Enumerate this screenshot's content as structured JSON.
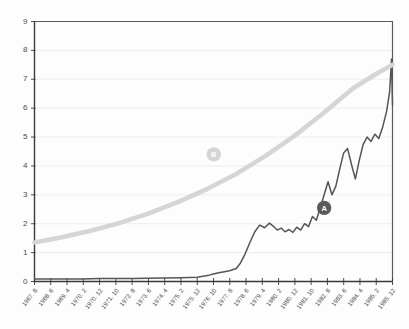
{
  "chart_data": {
    "type": "line",
    "title": "",
    "subtitle": "",
    "xlabel": "",
    "ylabel": "",
    "ylim": [
      0,
      9
    ],
    "grid": true,
    "legend_position": "none",
    "y_ticks": [
      0,
      1,
      2,
      3,
      4,
      5,
      6,
      7,
      8,
      9
    ],
    "categories": [
      "1967. 8",
      "1968. 6",
      "1969. 4",
      "1970. 2",
      "1970. 12",
      "1971. 10",
      "1972. 8",
      "1973. 6",
      "1974. 4",
      "1975. 2",
      "1975. 12",
      "1976. 10",
      "1977. 8",
      "1978. 6",
      "1979. 4",
      "1980. 2",
      "1980. 12",
      "1981. 10",
      "1982. 8",
      "1983. 6",
      "1984. 4",
      "1985. 2",
      "1985. 12"
    ],
    "series": [
      {
        "name": "A",
        "style": "observed",
        "color": "#555555",
        "x": [
          1967.67,
          1968.5,
          1969.33,
          1970.17,
          1971.0,
          1971.83,
          1972.67,
          1973.5,
          1974.33,
          1975.17,
          1976.0,
          1976.3,
          1976.6,
          1976.83,
          1977.1,
          1977.4,
          1977.7,
          1978.0,
          1978.2,
          1978.45,
          1978.7,
          1978.95,
          1979.2,
          1979.45,
          1979.7,
          1979.95,
          1980.1,
          1980.3,
          1980.5,
          1980.7,
          1980.9,
          1981.1,
          1981.3,
          1981.5,
          1981.7,
          1981.9,
          1982.1,
          1982.3,
          1982.5,
          1982.7,
          1982.9,
          1983.1,
          1983.3,
          1983.5,
          1983.7,
          1983.9,
          1984.1,
          1984.3,
          1984.5,
          1984.7,
          1984.9,
          1985.1,
          1985.3,
          1985.5,
          1985.7,
          1985.85,
          1985.95,
          1986.0
        ],
        "values": [
          0.09,
          0.09,
          0.09,
          0.09,
          0.1,
          0.1,
          0.1,
          0.11,
          0.12,
          0.13,
          0.15,
          0.18,
          0.22,
          0.26,
          0.3,
          0.34,
          0.38,
          0.45,
          0.62,
          0.95,
          1.35,
          1.72,
          1.95,
          1.86,
          2.02,
          1.88,
          1.78,
          1.85,
          1.72,
          1.8,
          1.7,
          1.88,
          1.78,
          2.0,
          1.9,
          2.25,
          2.12,
          2.55,
          3.0,
          3.45,
          3.0,
          3.3,
          3.9,
          4.45,
          4.6,
          4.05,
          3.55,
          4.2,
          4.75,
          5.0,
          4.85,
          5.1,
          4.95,
          5.35,
          5.9,
          6.55,
          7.7,
          6.1
        ]
      },
      {
        "name": "B",
        "style": "trend",
        "color": "#d5d5d5",
        "x": [
          1967.67,
          1969.0,
          1970.5,
          1972.0,
          1973.5,
          1975.0,
          1976.5,
          1978.0,
          1979.5,
          1981.0,
          1982.5,
          1984.0,
          1985.2,
          1986.0
        ],
        "values": [
          1.35,
          1.52,
          1.75,
          2.02,
          2.35,
          2.75,
          3.2,
          3.72,
          4.35,
          5.05,
          5.85,
          6.7,
          7.2,
          7.5
        ]
      }
    ],
    "annotations": [
      {
        "label": "A",
        "x": 1982.5,
        "y": 2.55,
        "kind": "dark-badge"
      },
      {
        "label": "B",
        "x": 1976.85,
        "y": 4.4,
        "kind": "light-badge"
      }
    ]
  }
}
